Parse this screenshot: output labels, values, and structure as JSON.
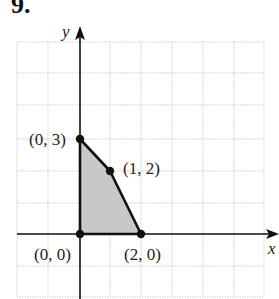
{
  "problem_number": "9.",
  "axes": {
    "x_label": "x",
    "y_label": "y",
    "x_range": [
      -2,
      6
    ],
    "y_range": [
      -2,
      6
    ],
    "grid": true,
    "unit_px": 31
  },
  "region": {
    "fill_color": "#c8c8c8",
    "stroke_color": "#111111",
    "vertices": [
      {
        "x": 0,
        "y": 0,
        "label": "(0, 0)"
      },
      {
        "x": 0,
        "y": 3,
        "label": "(0, 3)"
      },
      {
        "x": 1,
        "y": 2,
        "label": "(1, 2)"
      },
      {
        "x": 2,
        "y": 0,
        "label": "(2, 0)"
      }
    ]
  },
  "colors": {
    "grid": "#cfcfcf",
    "axis": "#111111",
    "point": "#111111"
  }
}
